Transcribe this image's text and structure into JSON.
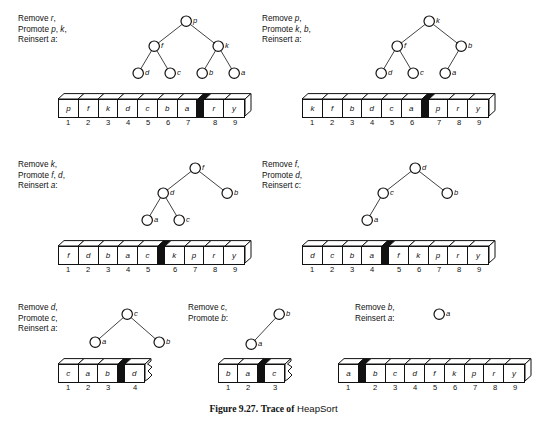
{
  "caption": {
    "number": "Figure 9.27.",
    "lead": "Trace of",
    "algorithm": "HeapSort"
  },
  "panels": [
    {
      "id": "panel-1",
      "labels": [
        "Remove r,",
        "Promote p, k,",
        "Reinsert a:"
      ],
      "tree": {
        "nodes": [
          {
            "key": "p",
            "x": 66,
            "y": 6
          },
          {
            "key": "f",
            "x": 34,
            "y": 31
          },
          {
            "key": "k",
            "x": 98,
            "y": 31
          },
          {
            "key": "d",
            "x": 18,
            "y": 58
          },
          {
            "key": "c",
            "x": 50,
            "y": 58
          },
          {
            "key": "b",
            "x": 82,
            "y": 58
          },
          {
            "key": "a",
            "x": 114,
            "y": 58
          }
        ],
        "edges": [
          [
            0,
            1
          ],
          [
            0,
            2
          ],
          [
            1,
            3
          ],
          [
            1,
            4
          ],
          [
            2,
            5
          ],
          [
            2,
            6
          ]
        ]
      },
      "array": {
        "cells": [
          "p",
          "f",
          "k",
          "d",
          "c",
          "b",
          "a",
          "#",
          "r",
          "y"
        ],
        "indices": [
          "1",
          "2",
          "3",
          "4",
          "5",
          "6",
          "7",
          "",
          "8",
          "9"
        ],
        "truncated": false
      }
    },
    {
      "id": "panel-2",
      "labels": [
        "Remove p,",
        "Promote k, b,",
        "Reinsert a:"
      ],
      "tree": {
        "nodes": [
          {
            "key": "k",
            "x": 72,
            "y": 6
          },
          {
            "key": "f",
            "x": 40,
            "y": 31
          },
          {
            "key": "b",
            "x": 104,
            "y": 31
          },
          {
            "key": "d",
            "x": 24,
            "y": 58
          },
          {
            "key": "c",
            "x": 56,
            "y": 58
          },
          {
            "key": "a",
            "x": 88,
            "y": 58
          }
        ],
        "edges": [
          [
            0,
            1
          ],
          [
            0,
            2
          ],
          [
            1,
            3
          ],
          [
            1,
            4
          ],
          [
            2,
            5
          ]
        ]
      },
      "array": {
        "cells": [
          "k",
          "f",
          "b",
          "d",
          "c",
          "a",
          "#",
          "p",
          "r",
          "y"
        ],
        "indices": [
          "1",
          "2",
          "3",
          "4",
          "5",
          "6",
          "",
          "7",
          "8",
          "9"
        ],
        "truncated": false
      }
    },
    {
      "id": "panel-3",
      "labels": [
        "Remove k,",
        "Promote f, d,",
        "Reinsert a:"
      ],
      "tree": {
        "nodes": [
          {
            "key": "f",
            "x": 66,
            "y": 6
          },
          {
            "key": "d",
            "x": 34,
            "y": 31
          },
          {
            "key": "b",
            "x": 98,
            "y": 31
          },
          {
            "key": "a",
            "x": 18,
            "y": 58
          },
          {
            "key": "c",
            "x": 50,
            "y": 58
          }
        ],
        "edges": [
          [
            0,
            1
          ],
          [
            0,
            2
          ],
          [
            1,
            3
          ],
          [
            1,
            4
          ]
        ]
      },
      "array": {
        "cells": [
          "f",
          "d",
          "b",
          "a",
          "c",
          "#",
          "k",
          "p",
          "r",
          "y"
        ],
        "indices": [
          "1",
          "2",
          "3",
          "4",
          "5",
          "",
          "6",
          "7",
          "8",
          "9"
        ],
        "truncated": false
      }
    },
    {
      "id": "panel-4",
      "labels": [
        "Remove f,",
        "Promote d,",
        "Reinsert c:"
      ],
      "tree": {
        "nodes": [
          {
            "key": "d",
            "x": 62,
            "y": 6
          },
          {
            "key": "c",
            "x": 30,
            "y": 31
          },
          {
            "key": "b",
            "x": 94,
            "y": 31
          },
          {
            "key": "a",
            "x": 14,
            "y": 58
          }
        ],
        "edges": [
          [
            0,
            1
          ],
          [
            0,
            2
          ],
          [
            1,
            3
          ]
        ]
      },
      "array": {
        "cells": [
          "d",
          "c",
          "b",
          "a",
          "#",
          "f",
          "k",
          "p",
          "r",
          "y"
        ],
        "indices": [
          "1",
          "2",
          "3",
          "4",
          "",
          "5",
          "6",
          "7",
          "8",
          "9"
        ],
        "truncated": false
      }
    },
    {
      "id": "panel-5",
      "labels": [
        "Remove d,",
        "Promote c,",
        "Reinsert a:"
      ],
      "tree": {
        "nodes": [
          {
            "key": "c",
            "x": 44,
            "y": 6
          },
          {
            "key": "a",
            "x": 12,
            "y": 34
          },
          {
            "key": "b",
            "x": 76,
            "y": 34
          }
        ],
        "edges": [
          [
            0,
            1
          ],
          [
            0,
            2
          ]
        ]
      },
      "array": {
        "cells": [
          "c",
          "a",
          "b",
          "#",
          "d"
        ],
        "indices": [
          "1",
          "2",
          "3",
          "",
          "4"
        ],
        "truncated": true
      }
    },
    {
      "id": "panel-6",
      "labels": [
        "Remove c,",
        "Promote b:"
      ],
      "tree": {
        "nodes": [
          {
            "key": "b",
            "x": 36,
            "y": 6
          },
          {
            "key": "a",
            "x": 8,
            "y": 36
          }
        ],
        "edges": [
          [
            0,
            1
          ]
        ]
      },
      "array": {
        "cells": [
          "b",
          "a",
          "#",
          "c"
        ],
        "indices": [
          "1",
          "2",
          "",
          "3"
        ],
        "truncated": true
      }
    },
    {
      "id": "panel-7",
      "labels": [
        "Remove b,",
        "Reinsert a:"
      ],
      "tree": {
        "nodes": [
          {
            "key": "a",
            "x": 10,
            "y": 6
          }
        ],
        "edges": []
      },
      "array": {
        "cells": [
          "a",
          "#",
          "b",
          "c",
          "d",
          "f",
          "k",
          "p",
          "r",
          "y"
        ],
        "indices": [
          "1",
          "",
          "2",
          "3",
          "4",
          "5",
          "6",
          "7",
          "8",
          "9"
        ],
        "truncated": false
      }
    }
  ],
  "colors": {
    "ink": "#111111",
    "paper": "#ffffff",
    "marker": "#111111"
  }
}
